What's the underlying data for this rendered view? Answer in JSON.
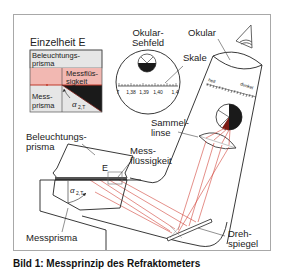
{
  "figure": {
    "caption": "Bild 1: Messprinzip des Refraktometers",
    "colors": {
      "frame": "#a8a8a8",
      "light_ray": "#d2453a",
      "liquid_pink": "#f2b8b2",
      "prism_gray": "#e6e6e6",
      "dark": "#1a1a1a"
    }
  },
  "detail": {
    "title": "Einzelheit E",
    "illum_prism": "Beleuchtungs-\nprisma",
    "illum_prism_l1": "Beleuchtungs-",
    "illum_prism_l2": "prisma",
    "liquid_l1": "Messflüs-",
    "liquid_l2": "sigkeit",
    "meas_prism_l1": "Mess-",
    "meas_prism_l2": "prisma",
    "angle": "α",
    "angle_sub": "2,T"
  },
  "eyepiece_field": {
    "title_l1": "Okular-",
    "title_l2": "Sehfeld",
    "scale_ticks": [
      "7",
      "1,38",
      "1,39",
      "1,40",
      "1,4"
    ]
  },
  "labels": {
    "okular": "Okular",
    "skale": "Skale",
    "hell": "hell",
    "dunkel": "dunkel",
    "sammellinse_l1": "Sammel-",
    "sammellinse_l2": "linse",
    "messfluessigkeit_l1": "Mess-",
    "messfluessigkeit_l2": "flüssigkeit",
    "beleuchtungsprisma_l1": "Beleuchtungs-",
    "beleuchtungsprisma_l2": "prisma",
    "detail_marker": "E",
    "angle": "α",
    "angle_sub": "2,T",
    "messprisma": "Messprisma",
    "drehspiegel_l1": "Dreh-",
    "drehspiegel_l2": "spiegel"
  }
}
